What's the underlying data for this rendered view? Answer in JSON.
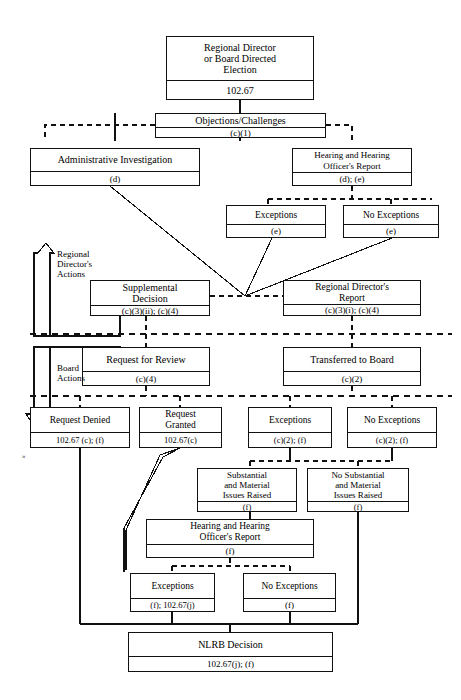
{
  "diagram": {
    "nodes": [
      {
        "id": "election",
        "title": "Regional Director\nor Board Directed\nElection",
        "cite": "102.67"
      },
      {
        "id": "objections",
        "title": "Objections/Challenges",
        "cite": "(c)(1)"
      },
      {
        "id": "admin-inv",
        "title": "Administrative Investigation",
        "cite": "(d)"
      },
      {
        "id": "hearing-1",
        "title": "Hearing and Hearing\nOfficer's Report",
        "cite": "(d); (e)"
      },
      {
        "id": "exceptions-1",
        "title": "Exceptions",
        "cite": "(e)"
      },
      {
        "id": "no-exceptions-1",
        "title": "No Exceptions",
        "cite": "(e)"
      },
      {
        "id": "supp-decision",
        "title": "Supplemental\nDecision",
        "cite": "(c)(3)(ii); (c)(4)"
      },
      {
        "id": "rd-report",
        "title": "Regional Director's\nReport",
        "cite": "(c)(3)(i); (c)(4)"
      },
      {
        "id": "request-review",
        "title": "Request for Review",
        "cite": "(c)(4)"
      },
      {
        "id": "transferred",
        "title": "Transferred to Board",
        "cite": "(c)(2)"
      },
      {
        "id": "req-denied",
        "title": "Request Denied",
        "cite": "102.67 (c); (f)"
      },
      {
        "id": "req-granted",
        "title": "Request\nGranted",
        "cite": "102.67(c)"
      },
      {
        "id": "exceptions-2",
        "title": "Exceptions",
        "cite": "(c)(2); (f)"
      },
      {
        "id": "no-exceptions-2",
        "title": "No Exceptions",
        "cite": "(c)(2); (f)"
      },
      {
        "id": "substantial",
        "title": "Substantial\nand Material\nIssues Raised",
        "cite": "(f)"
      },
      {
        "id": "no-substantial",
        "title": "No Substantial\nand Material\nIssues Raised",
        "cite": "(f)"
      },
      {
        "id": "hearing-2",
        "title": "Hearing and Hearing\nOfficer's Report",
        "cite": "(f)"
      },
      {
        "id": "exceptions-3",
        "title": "Exceptions",
        "cite": "(f); 102.67(j)"
      },
      {
        "id": "no-exceptions-3",
        "title": "No Exceptions",
        "cite": "(f)"
      },
      {
        "id": "nlrb-decision",
        "title": "NLRB Decision",
        "cite": "102.67(j); (f)"
      }
    ],
    "bands": [
      {
        "id": "rd-actions",
        "label": "Regional\nDirector's\nActions",
        "arrow": "up"
      },
      {
        "id": "board-actions",
        "label": "Board\nActions",
        "arrow": "down"
      }
    ],
    "colors": {
      "line": "#111111",
      "background": "#ffffff",
      "text": "#000000"
    },
    "stray_mark": "»"
  }
}
